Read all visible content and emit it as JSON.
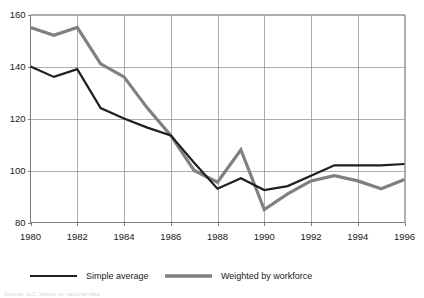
{
  "chart_data": {
    "type": "line",
    "title": "",
    "subtitle": "",
    "xlabel": "",
    "ylabel": "",
    "xlim": [
      1980,
      1996
    ],
    "ylim": [
      80,
      160
    ],
    "ytick_step": 20,
    "xtick_step": 2,
    "grid": true,
    "grid_x": true,
    "grid_y": true,
    "legend_position": "bottom",
    "x": [
      1980,
      1981,
      1982,
      1983,
      1984,
      1985,
      1986,
      1987,
      1988,
      1989,
      1990,
      1991,
      1992,
      1993,
      1994,
      1995,
      1996
    ],
    "xtick_labels": [
      "1980",
      "1982",
      "1984",
      "1986",
      "1988",
      "1990",
      "1992",
      "1994",
      "1996"
    ],
    "xtick_values": [
      1980,
      1982,
      1984,
      1986,
      1988,
      1990,
      1992,
      1994,
      1996
    ],
    "ytick_labels": [
      "80",
      "100",
      "120",
      "140",
      "160"
    ],
    "ytick_values": [
      80,
      100,
      120,
      140,
      160
    ],
    "series": [
      {
        "name": "Simple average",
        "color": "#1f1f1f",
        "width": 2.2,
        "values": [
          140,
          136,
          139,
          124,
          120,
          116.5,
          113.5,
          103,
          93,
          97,
          92.5,
          94,
          98,
          102,
          102,
          102,
          102.5
        ]
      },
      {
        "name": "Weighted by workforce",
        "color": "#808080",
        "width": 3.2,
        "values": [
          155,
          152,
          155,
          141,
          136,
          124,
          113.5,
          100,
          95.5,
          108,
          85,
          91,
          96,
          98,
          96,
          93,
          96.5
        ]
      }
    ]
  },
  "legend": {
    "entries": [
      {
        "label": "Simple average",
        "color": "#1f1f1f",
        "width": 2.2
      },
      {
        "label": "Weighted by workforce",
        "color": "#808080",
        "width": 3.4
      }
    ]
  },
  "footnote": {
    "text": "Source: ILO, based on national data"
  }
}
